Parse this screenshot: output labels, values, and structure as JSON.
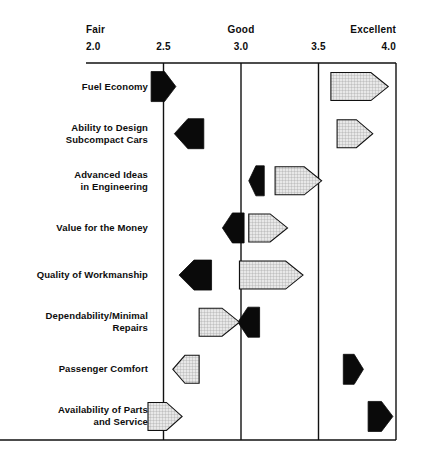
{
  "chart_data": {
    "type": "bar",
    "title": "",
    "subtitle": "",
    "xlabel": "",
    "ylabel": "",
    "xlim": [
      2.0,
      4.0
    ],
    "grid": true,
    "gridlines": [
      2.5,
      3.0,
      3.5,
      4.0
    ],
    "legend_position": "none",
    "axis": {
      "ticks": [
        "2.0",
        "2.5",
        "3.0",
        "3.5",
        "4.0"
      ],
      "tick_values": [
        2.0,
        2.5,
        3.0,
        3.5,
        4.0
      ],
      "qualitative_labels": [
        {
          "text": "Fair",
          "value": 2.0,
          "align": "left"
        },
        {
          "text": "Good",
          "value": 3.0,
          "align": "center"
        },
        {
          "text": "Excellent",
          "value": 4.0,
          "align": "right"
        }
      ]
    },
    "categories": [
      "Fuel Economy",
      "Ability to Design\nSubcompact Cars",
      "Advanced Ideas\nin Engineering",
      "Value for the Money",
      "Quality of Workmanship",
      "Dependability/Minimal\nRepairs",
      "Passenger Comfort",
      "Availability of Parts\nand Service"
    ],
    "series": [
      {
        "name": "black",
        "style": "solid-black",
        "color": "#0a0a0a",
        "markers": [
          {
            "category": "Fuel Economy",
            "start": 2.42,
            "end": 2.58,
            "direction": "right"
          },
          {
            "category": "Ability to Design Subcompact Cars",
            "start": 2.57,
            "end": 2.76,
            "direction": "left"
          },
          {
            "category": "Advanced Ideas in Engineering",
            "start": 3.05,
            "end": 3.15,
            "direction": "left"
          },
          {
            "category": "Value for the Money",
            "start": 2.88,
            "end": 3.02,
            "direction": "left"
          },
          {
            "category": "Quality of Workmanship",
            "start": 2.6,
            "end": 2.81,
            "direction": "left"
          },
          {
            "category": "Dependability/Minimal Repairs",
            "start": 2.98,
            "end": 3.12,
            "direction": "left"
          },
          {
            "category": "Passenger Comfort",
            "start": 3.66,
            "end": 3.79,
            "direction": "right"
          },
          {
            "category": "Availability of Parts and Service",
            "start": 3.82,
            "end": 3.98,
            "direction": "right"
          }
        ]
      },
      {
        "name": "gray",
        "style": "hatched-gray",
        "color": "#d8d8d8",
        "markers": [
          {
            "category": "Fuel Economy",
            "start": 3.58,
            "end": 3.95,
            "direction": "right"
          },
          {
            "category": "Ability to Design Subcompact Cars",
            "start": 3.62,
            "end": 3.85,
            "direction": "right"
          },
          {
            "category": "Advanced Ideas in Engineering",
            "start": 3.22,
            "end": 3.52,
            "direction": "right"
          },
          {
            "category": "Value for the Money",
            "start": 3.05,
            "end": 3.3,
            "direction": "right"
          },
          {
            "category": "Quality of Workmanship",
            "start": 2.99,
            "end": 3.4,
            "direction": "right"
          },
          {
            "category": "Dependability/Minimal Repairs",
            "start": 2.73,
            "end": 2.99,
            "direction": "right"
          },
          {
            "category": "Passenger Comfort",
            "start": 2.56,
            "end": 2.73,
            "direction": "left"
          },
          {
            "category": "Availability of Parts and Service",
            "start": 2.4,
            "end": 2.62,
            "direction": "right"
          }
        ]
      }
    ]
  }
}
